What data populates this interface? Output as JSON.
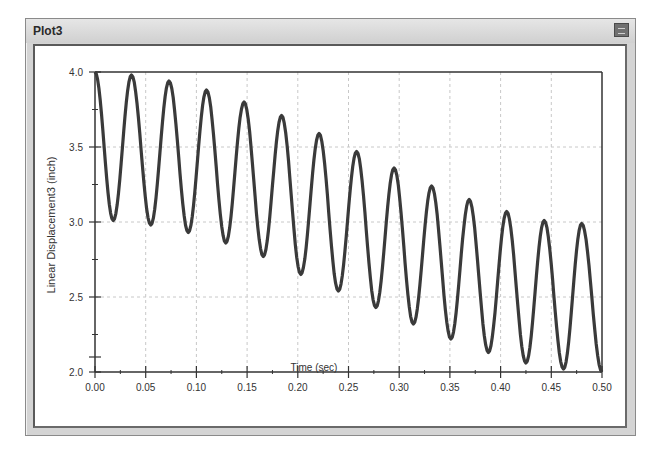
{
  "window": {
    "title": "Plot3",
    "close_label": "close"
  },
  "chart_data": {
    "type": "line",
    "title": "",
    "xlabel": "Time (sec)",
    "ylabel": "Linear Displacement3 (inch)",
    "xlim": [
      0.0,
      0.5
    ],
    "ylim": [
      2.0,
      4.0
    ],
    "x_ticks": [
      "0.00",
      "0.05",
      "0.10",
      "0.15",
      "0.20",
      "0.25",
      "0.30",
      "0.35",
      "0.40",
      "0.45",
      "0.50"
    ],
    "y_ticks": [
      "2.0",
      "2.5",
      "3.0",
      "3.5",
      "4.0"
    ],
    "grid": true,
    "legend": "none",
    "series": [
      {
        "name": "Linear Displacement3",
        "color": "#3a3a3a",
        "extrema": [
          {
            "t": 0.0,
            "y": 4.0
          },
          {
            "t": 0.018,
            "y": 3.01
          },
          {
            "t": 0.036,
            "y": 3.98
          },
          {
            "t": 0.055,
            "y": 2.98
          },
          {
            "t": 0.073,
            "y": 3.94
          },
          {
            "t": 0.092,
            "y": 2.93
          },
          {
            "t": 0.11,
            "y": 3.88
          },
          {
            "t": 0.129,
            "y": 2.86
          },
          {
            "t": 0.147,
            "y": 3.8
          },
          {
            "t": 0.166,
            "y": 2.77
          },
          {
            "t": 0.184,
            "y": 3.71
          },
          {
            "t": 0.203,
            "y": 2.65
          },
          {
            "t": 0.221,
            "y": 3.59
          },
          {
            "t": 0.24,
            "y": 2.54
          },
          {
            "t": 0.258,
            "y": 3.47
          },
          {
            "t": 0.277,
            "y": 2.43
          },
          {
            "t": 0.295,
            "y": 3.36
          },
          {
            "t": 0.314,
            "y": 2.32
          },
          {
            "t": 0.332,
            "y": 3.24
          },
          {
            "t": 0.351,
            "y": 2.22
          },
          {
            "t": 0.369,
            "y": 3.15
          },
          {
            "t": 0.388,
            "y": 2.13
          },
          {
            "t": 0.406,
            "y": 3.07
          },
          {
            "t": 0.425,
            "y": 2.06
          },
          {
            "t": 0.443,
            "y": 3.01
          },
          {
            "t": 0.462,
            "y": 2.02
          },
          {
            "t": 0.48,
            "y": 2.99
          },
          {
            "t": 0.5,
            "y": 2.0
          }
        ]
      }
    ]
  }
}
